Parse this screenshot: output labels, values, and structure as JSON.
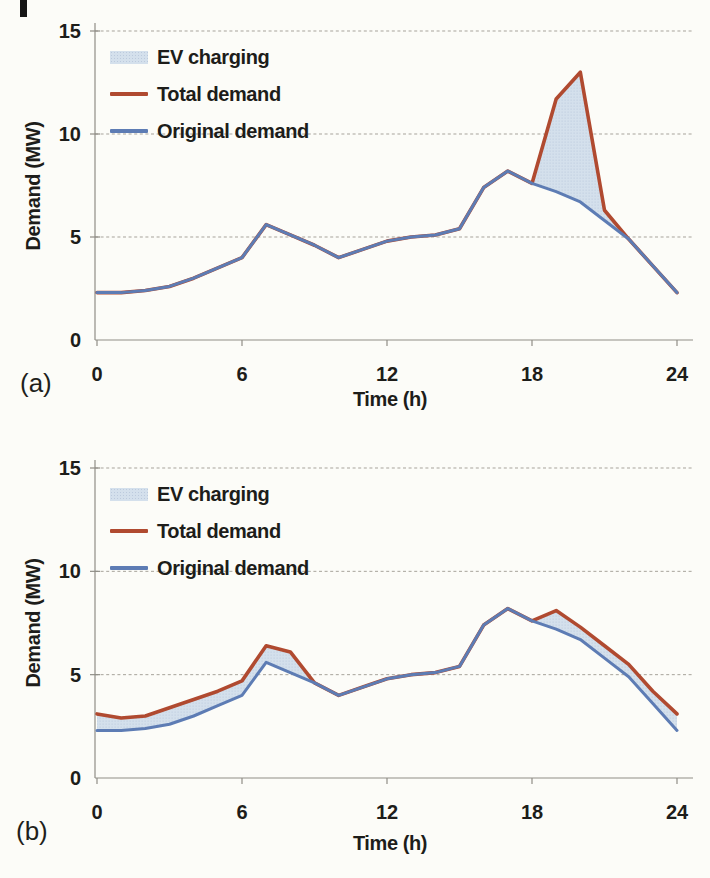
{
  "page": {
    "background": "#fcfcf8",
    "text_color": "#1d1d1a"
  },
  "chart_data": [
    {
      "type": "area",
      "panel_label": "(a)",
      "title": "",
      "xlabel": "Time (h)",
      "ylabel": "Demand (MW)",
      "x": [
        0,
        1,
        2,
        3,
        4,
        5,
        6,
        7,
        8,
        9,
        10,
        11,
        12,
        13,
        14,
        15,
        16,
        17,
        18,
        19,
        20,
        21,
        22,
        23,
        24
      ],
      "series": [
        {
          "name": "Total demand",
          "color": "#b04a30",
          "values": [
            2.3,
            2.3,
            2.4,
            2.6,
            3.0,
            3.5,
            4.0,
            5.6,
            5.1,
            4.6,
            4.0,
            4.4,
            4.8,
            5.0,
            5.1,
            5.4,
            7.4,
            8.2,
            7.6,
            11.7,
            13.0,
            6.3,
            4.9,
            3.6,
            2.3
          ]
        },
        {
          "name": "Original demand",
          "color": "#5d7cb4",
          "values": [
            2.3,
            2.3,
            2.4,
            2.6,
            3.0,
            3.5,
            4.0,
            5.6,
            5.1,
            4.6,
            4.0,
            4.4,
            4.8,
            5.0,
            5.1,
            5.4,
            7.4,
            8.2,
            7.6,
            7.2,
            6.7,
            5.8,
            4.9,
            3.6,
            2.3
          ]
        }
      ],
      "area_between": {
        "name": "EV charging",
        "upper": "Total demand",
        "lower": "Original demand",
        "color": "#d4e0ec"
      },
      "xlim": [
        0,
        24
      ],
      "ylim": [
        0,
        15
      ],
      "xticks": [
        0,
        6,
        12,
        18,
        24
      ],
      "yticks": [
        0,
        5,
        10,
        15
      ],
      "grid": "horizontal-dashed",
      "legend_position": "top-left"
    },
    {
      "type": "area",
      "panel_label": "(b)",
      "title": "",
      "xlabel": "Time (h)",
      "ylabel": "Demand (MW)",
      "x": [
        0,
        1,
        2,
        3,
        4,
        5,
        6,
        7,
        8,
        9,
        10,
        11,
        12,
        13,
        14,
        15,
        16,
        17,
        18,
        19,
        20,
        21,
        22,
        23,
        24
      ],
      "series": [
        {
          "name": "Total demand",
          "color": "#b04a30",
          "values": [
            3.1,
            2.9,
            3.0,
            3.4,
            3.8,
            4.2,
            4.7,
            6.4,
            6.1,
            4.6,
            4.0,
            4.4,
            4.8,
            5.0,
            5.1,
            5.4,
            7.4,
            8.2,
            7.6,
            8.1,
            7.3,
            6.4,
            5.5,
            4.2,
            3.1
          ]
        },
        {
          "name": "Original demand",
          "color": "#5d7cb4",
          "values": [
            2.3,
            2.3,
            2.4,
            2.6,
            3.0,
            3.5,
            4.0,
            5.6,
            5.1,
            4.6,
            4.0,
            4.4,
            4.8,
            5.0,
            5.1,
            5.4,
            7.4,
            8.2,
            7.6,
            7.2,
            6.7,
            5.8,
            4.9,
            3.6,
            2.3
          ]
        }
      ],
      "area_between": {
        "name": "EV charging",
        "upper": "Total demand",
        "lower": "Original demand",
        "color": "#d4e0ec"
      },
      "xlim": [
        0,
        24
      ],
      "ylim": [
        0,
        15
      ],
      "xticks": [
        0,
        6,
        12,
        18,
        24
      ],
      "yticks": [
        0,
        5,
        10,
        15
      ],
      "grid": "horizontal-dashed",
      "legend_position": "top-left"
    }
  ]
}
